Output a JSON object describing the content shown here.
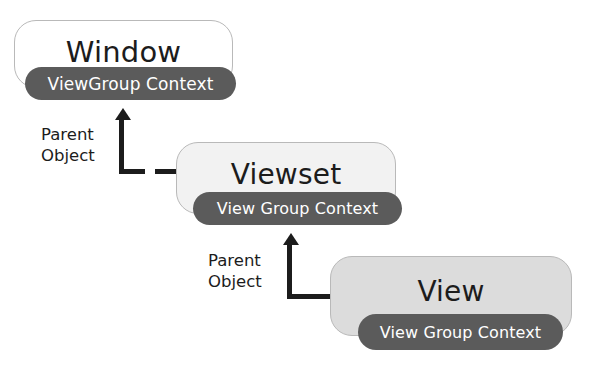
{
  "diagram": {
    "colors": {
      "pill_fill": "#5b5b5b",
      "pill_text": "#ffffff",
      "node_border": "#b9b9b9",
      "window_fill": "#ffffff",
      "viewset_fill": "#f2f2f2",
      "view_fill": "#dcdcdc",
      "line": "#1c1c1c",
      "background": "#ffffff"
    },
    "nodes": [
      {
        "id": "window",
        "title": "Window",
        "pill_label": "ViewGroup Context",
        "fill": "#ffffff"
      },
      {
        "id": "viewset",
        "title": "Viewset",
        "pill_label": "View Group Context",
        "fill": "#f2f2f2"
      },
      {
        "id": "view",
        "title": "View",
        "pill_label": "View Group Context",
        "fill": "#dcdcdc"
      }
    ],
    "connectors": [
      {
        "id": "viewset-to-window",
        "label_line1": "Parent",
        "label_line2": "Object",
        "from": "viewset",
        "to": "window",
        "arrow": "up"
      },
      {
        "id": "view-to-viewset",
        "label_line1": "Parent",
        "label_line2": "Object",
        "from": "view",
        "to": "viewset",
        "arrow": "up"
      }
    ]
  }
}
